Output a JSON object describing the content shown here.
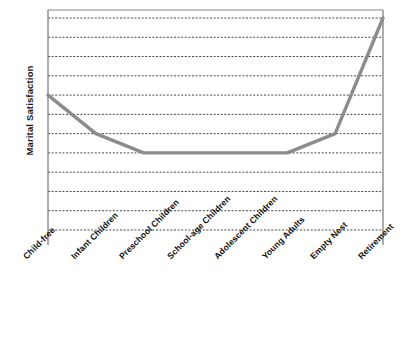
{
  "chart_data": {
    "type": "line",
    "title": "",
    "subtitle": "",
    "xlabel": "",
    "ylabel": "Marital Satisfaction",
    "categories": [
      "Child-free",
      "Infant Children",
      "Preschool Children",
      "School-age Children",
      "Adolescent Children",
      "Young Adults",
      "Empty Nest",
      "Retirement"
    ],
    "series": [
      {
        "name": "Marital Satisfaction",
        "values": [
          7,
          5,
          4,
          4,
          4,
          4,
          5,
          11
        ]
      }
    ],
    "ylim": [
      0,
      11
    ],
    "yticks": [],
    "ytick_labels": [],
    "grid": "horizontal-dotted",
    "legend": "none",
    "line_color": "#8c8c8c",
    "grid_color": "#444444",
    "axis_color": "#808080",
    "annotations": []
  },
  "axes": {
    "y_axis_label": "Marital Satisfaction"
  }
}
